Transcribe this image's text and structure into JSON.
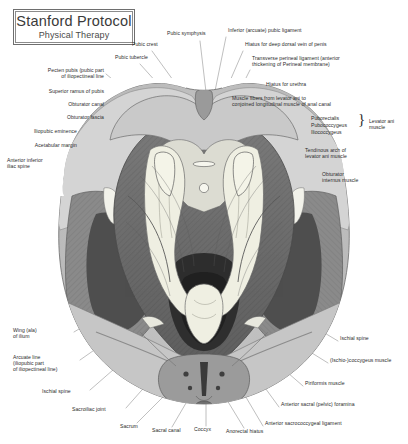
{
  "page": {
    "width": 408,
    "height": 444,
    "background": "#ffffff",
    "text_color": "#2b2b2b"
  },
  "title_block": {
    "main": "Stanford Protocol",
    "sub": "Physical Therapy",
    "border_color": "#6e6e6e"
  },
  "figure": {
    "name": "pelvic-floor-superior-view",
    "palette": {
      "paper": "#ffffff",
      "bone_light": "#d8d8d8",
      "bone_mid": "#c2c2c2",
      "muscle_light": "#b0b0b0",
      "muscle_mid": "#8f8f8f",
      "muscle_dark": "#6b6b6b",
      "deep_dark": "#4a4a4a",
      "deepest": "#2f2f2f",
      "highlight": "#efefe4",
      "outline": "#555555",
      "leader_line": "#7a7a7a"
    }
  },
  "labels": {
    "left": [
      {
        "id": "pecten-pubis",
        "text": "Pecten pubis (pubic part\nof iliopectineal line",
        "x": 24,
        "y": 70,
        "align": "right",
        "w": 80
      },
      {
        "id": "superior-ramus-of-pubis",
        "text": "Superior ramus of pubis",
        "x": 21,
        "y": 91,
        "align": "right",
        "w": 83
      },
      {
        "id": "obturator-canal",
        "text": "Obturator canal",
        "x": 47,
        "y": 104,
        "align": "right",
        "w": 57
      },
      {
        "id": "obturator-fascia",
        "text": "Obturator fascia",
        "x": 44,
        "y": 117,
        "align": "right",
        "w": 60
      },
      {
        "id": "iliopubic-eminence",
        "text": "Iliopubic eminence",
        "x": 7,
        "y": 131,
        "align": "right",
        "w": 70
      },
      {
        "id": "acetabular-margin",
        "text": "Acetabular margin",
        "x": 7,
        "y": 145,
        "align": "right",
        "w": 70
      },
      {
        "id": "anterior-inferior-iliac-spine",
        "text": "Anterior inferior\niliac spine",
        "x": 7,
        "y": 160,
        "align": "left",
        "w": 70
      },
      {
        "id": "wing-ala-of-ilium",
        "text": "Wing (ala)\nof ilium",
        "x": 13,
        "y": 330,
        "align": "left",
        "w": 60
      },
      {
        "id": "arcuate-line",
        "text": "Arcuate line\n(iliopubic part\nof iliopectineal line)",
        "x": 13,
        "y": 357,
        "align": "left",
        "w": 72
      },
      {
        "id": "ischial-spine-left",
        "text": "Ischial spine",
        "x": 42,
        "y": 391,
        "align": "left",
        "w": 48
      },
      {
        "id": "sacroiliac-joint",
        "text": "Sacroiliac joint",
        "x": 72,
        "y": 409,
        "align": "left",
        "w": 54
      }
    ],
    "top": [
      {
        "id": "pubic-crest",
        "text": "Pubic crest",
        "x": 132,
        "y": 44,
        "align": "left",
        "w": 42
      },
      {
        "id": "pubic-tubercle",
        "text": "Pubic tubercle",
        "x": 115,
        "y": 57,
        "align": "left",
        "w": 52
      },
      {
        "id": "pubic-symphysis",
        "text": "Pubic symphysis",
        "x": 167,
        "y": 33,
        "align": "left",
        "w": 58
      }
    ],
    "bottom": [
      {
        "id": "sacrum",
        "text": "Sacrum",
        "x": 120,
        "y": 426,
        "align": "left",
        "w": 32
      },
      {
        "id": "sacral-canal",
        "text": "Sacral canal",
        "x": 152,
        "y": 430,
        "align": "left",
        "w": 44
      },
      {
        "id": "coccyx",
        "text": "Coccyx",
        "x": 194,
        "y": 429,
        "align": "left",
        "w": 30
      },
      {
        "id": "anorectal-hiatus",
        "text": "Anorectal hiatus",
        "x": 226,
        "y": 431,
        "align": "left",
        "w": 58
      }
    ],
    "right": [
      {
        "id": "inferior-arcuate-pubic-ligament",
        "text": "Inferior (arcuate) pubic ligament",
        "x": 228,
        "y": 30,
        "align": "left",
        "w": 115
      },
      {
        "id": "hiatus-for-deep-dorsal-vein-of-penis",
        "text": "Hiatus for deep dorsal vein of penis",
        "x": 245,
        "y": 44,
        "align": "left",
        "w": 126
      },
      {
        "id": "transverse-perineal-ligament",
        "text": "Transverse perineal ligament (anterior\nthickening of Perineal membrane)",
        "x": 252,
        "y": 58,
        "align": "left",
        "w": 140
      },
      {
        "id": "hiatus-for-urethra",
        "text": "Hiatus for urethra",
        "x": 266,
        "y": 84,
        "align": "left",
        "w": 62
      },
      {
        "id": "muscle-fibers-levator-ani",
        "text": "Muscle fibers from levator ani to\nconjoined longitudinal muscle of anal canal",
        "x": 232,
        "y": 98,
        "align": "left",
        "w": 156
      },
      {
        "id": "tendinous-arch-levator-ani",
        "text": "Tendinous arch of\nlevator ani muscle",
        "x": 305,
        "y": 150,
        "align": "left",
        "w": 68
      },
      {
        "id": "obturator-internus-muscle",
        "text": "Obturator\ninternus muscle",
        "x": 322,
        "y": 174,
        "align": "left",
        "w": 62
      },
      {
        "id": "ischial-spine-right",
        "text": "Ischial spine",
        "x": 340,
        "y": 338,
        "align": "left",
        "w": 48
      },
      {
        "id": "ischio-coccygeus-muscle",
        "text": "(Ischio-)coccygeus muscle",
        "x": 330,
        "y": 360,
        "align": "left",
        "w": 96
      },
      {
        "id": "piriformis-muscle",
        "text": "Piriformis muscle",
        "x": 305,
        "y": 383,
        "align": "left",
        "w": 64
      },
      {
        "id": "anterior-sacral-pelvic-foramina",
        "text": "Anterior sacral (pelvic) foramina",
        "x": 281,
        "y": 404,
        "align": "left",
        "w": 114
      },
      {
        "id": "anterior-sacrococcygeal-ligament",
        "text": "Anterior sacrococcygeal ligament",
        "x": 265,
        "y": 423,
        "align": "left",
        "w": 118
      }
    ],
    "levator_group": {
      "items": [
        "Puborectalis",
        "Pubococcygeus",
        "Iliococcygeus"
      ],
      "group_label": "Levator ani\nmuscle",
      "x": 311,
      "y": 118,
      "brace_x": 360,
      "group_x": 369
    }
  }
}
